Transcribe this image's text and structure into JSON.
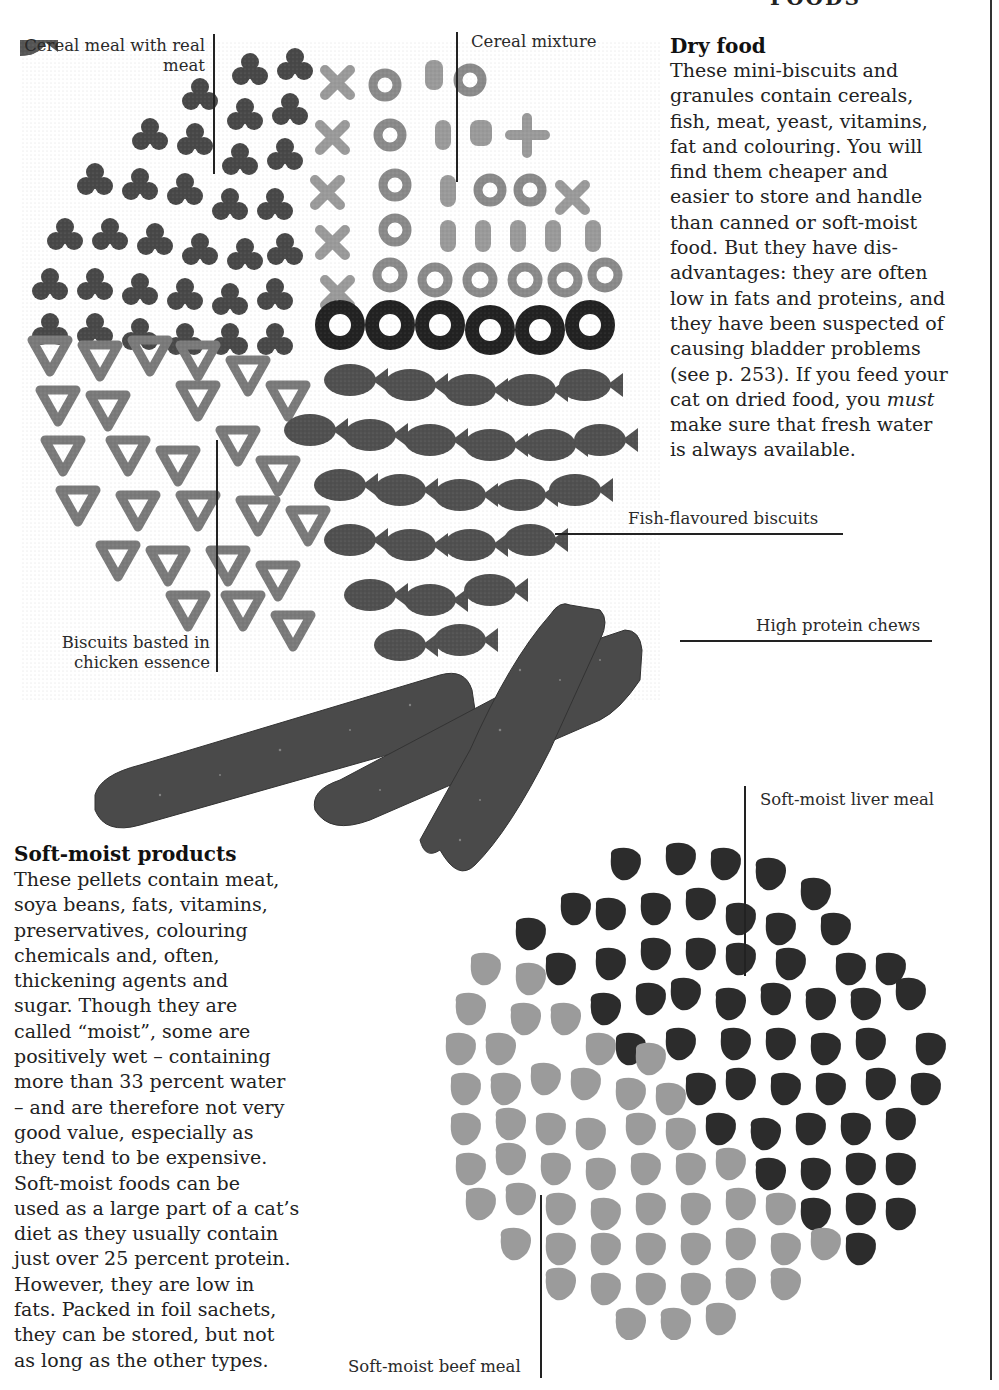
{
  "page": {
    "header_fragment": "FOODS"
  },
  "dry_food": {
    "heading": "Dry food",
    "lines": [
      "These mini-biscuits and",
      "granules contain cereals,",
      "fish, meat, yeast, vitamins,",
      "fat and colouring. You will",
      "find them cheaper and",
      "easier to store and handle",
      "than canned or soft-moist",
      "food. But they have dis-",
      "advantages: they are often",
      "low in fats and proteins, and",
      "they have been suspected of",
      "causing bladder problems",
      "(see p. 253). If you feed your"
    ],
    "line_pre_italic": "cat on dried food, you ",
    "italic_word": "must",
    "lines_after": [
      "make sure that fresh water",
      "is always available."
    ]
  },
  "soft_moist": {
    "heading": "Soft-moist products",
    "lines": [
      "These pellets contain meat,",
      "soya beans, fats, vitamins,",
      "preservatives, colouring",
      "chemicals and, often,",
      "thickening agents and",
      "sugar. Though they are",
      "called “moist”, some are",
      "positively wet – containing",
      "more than 33 percent water",
      "– and are therefore not very",
      "good value, especially as",
      "they tend to be expensive.",
      "Soft-moist foods can be",
      "used as a large part of a cat’s",
      "diet as they usually contain",
      "just over 25 percent protein.",
      "However, they are low in",
      "fats. Packed in foil sachets,",
      "they can be stored, but not",
      "as long as the other types."
    ]
  },
  "labels": {
    "cereal_meal_line1": "Cereal meal with real",
    "cereal_meal_line2": "meat",
    "cereal_mixture": "Cereal mixture",
    "fish_biscuits": "Fish-flavoured biscuits",
    "chicken_line1": "Biscuits basted in",
    "chicken_line2": "chicken essence",
    "high_protein": "High protein chews",
    "liver_meal": "Soft-moist liver meal",
    "beef_meal": "Soft-moist beef meal"
  },
  "colors": {
    "ink": "#1c1c1c",
    "dark_kibble": "#2e2e2e",
    "mid_kibble": "#5a5a5a",
    "light_kibble": "#9a9a9a",
    "chew": "#4a4a4a"
  }
}
